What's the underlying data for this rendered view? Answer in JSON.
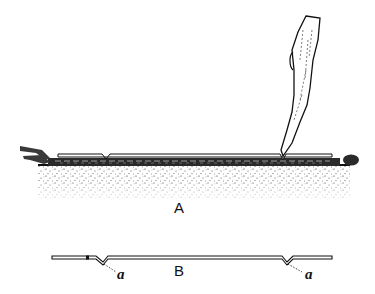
{
  "figure": {
    "panels": [
      {
        "id": "A",
        "label": "A",
        "description": "Shoot laid horizontally on soil, held with a wooden peg, notched near buds"
      },
      {
        "id": "B",
        "label": "B",
        "description": "Detached stem showing notches"
      }
    ],
    "annotations": [
      {
        "label": "a",
        "target": "left notch"
      },
      {
        "label": "a",
        "target": "right notch"
      }
    ],
    "colors": {
      "ink": "#111111",
      "paper": "#ffffff"
    }
  }
}
